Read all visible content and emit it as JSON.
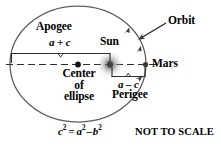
{
  "figure": {
    "note": "NOT TO SCALE",
    "equation": {
      "lhs_base": "c",
      "lhs_exp": "2",
      "eq": "=",
      "rhs1_base": "a",
      "rhs1_exp": "2",
      "minus": "–",
      "rhs2_base": "b",
      "rhs2_exp": "2",
      "plain": "c² = a² – b²"
    },
    "labels": {
      "apogee": "Apogee",
      "apogee_measure": "a + c",
      "sun": "Sun",
      "orbit": "Orbit",
      "mars": "Mars",
      "perigee": "Perigee",
      "perigee_measure": "a – c",
      "center_line1": "Center",
      "center_line2": "of",
      "center_line3": "ellipse"
    },
    "colors": {
      "ink": "#000000",
      "orbit_stroke": "#5b5b5b",
      "axis_stroke": "#333333",
      "sun_glow": "#8a8a8a",
      "background": "#ffffff"
    },
    "geometry": {
      "ellipse_center_x": 78,
      "ellipse_center_y": 64,
      "semi_major_a": 68,
      "semi_minor_b": 58,
      "sun_x": 110,
      "sun_y": 64,
      "mars_x": 145,
      "mars_y": 64,
      "apogee_brace_left_x": 11,
      "apogee_brace_right_x": 110,
      "apogee_brace_y": 53,
      "perigee_brace_left_x": 112,
      "perigee_brace_right_x": 145,
      "perigee_brace_y": 75
    }
  }
}
